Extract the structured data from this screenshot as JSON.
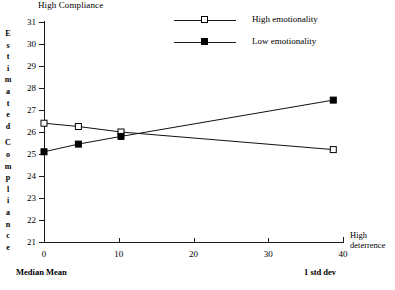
{
  "chart_data": {
    "type": "line",
    "title": "High Compliance",
    "xlabel": "High deterrence",
    "ylabel": "Estimated Compliance",
    "xlim": [
      0,
      40
    ],
    "ylim": [
      21,
      31
    ],
    "grid": false,
    "legend_position": "top-center",
    "x_ticks": [
      "0",
      "10",
      "20",
      "30",
      "40"
    ],
    "x_tick_values": [
      0,
      10,
      20,
      30,
      40
    ],
    "y_ticks": [
      "21",
      "22",
      "23",
      "24",
      "25",
      "26",
      "27",
      "28",
      "29",
      "30",
      "31"
    ],
    "y_tick_values": [
      21,
      22,
      23,
      24,
      25,
      26,
      27,
      28,
      29,
      30,
      31
    ],
    "annotations": [
      {
        "text": "Median Mean",
        "position": "bottom-left"
      },
      {
        "text": "1 std dev",
        "position": "bottom-right"
      }
    ],
    "series": [
      {
        "name": "High emotionality",
        "marker": "open-square",
        "x": [
          0.0,
          4.6,
          10.3,
          38.7
        ],
        "values": [
          26.4,
          26.25,
          26.0,
          25.2
        ]
      },
      {
        "name": "Low emotionality",
        "marker": "filled-square",
        "x": [
          0.0,
          4.6,
          10.3,
          38.7
        ],
        "values": [
          25.1,
          25.45,
          25.8,
          27.45
        ]
      }
    ]
  },
  "ylabel_letters": [
    "E",
    "s",
    "t",
    "i",
    "m",
    "a",
    "t",
    "e",
    "d",
    "",
    "C",
    "o",
    "m",
    "p",
    "l",
    "i",
    "a",
    "n",
    "c",
    "e"
  ],
  "axis_end_label": {
    "line1": "High",
    "line2": "deterrence"
  },
  "legend": {
    "items": [
      {
        "label": "High emotionality",
        "marker": "open-square"
      },
      {
        "label": "Low emotionality",
        "marker": "filled-square"
      }
    ]
  }
}
